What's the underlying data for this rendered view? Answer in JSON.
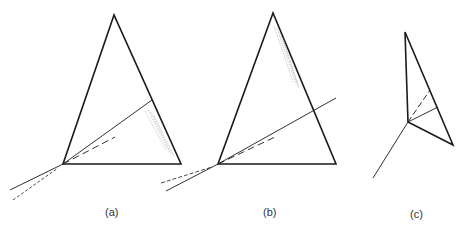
{
  "figure": {
    "panels": [
      {
        "id": "a",
        "label": "(a)"
      },
      {
        "id": "b",
        "label": "(b)"
      },
      {
        "id": "c",
        "label": "(c)"
      }
    ]
  },
  "colors": {
    "stroke": "#1a1a1a",
    "hatch": "#9a9a9a",
    "background": "#ffffff"
  }
}
